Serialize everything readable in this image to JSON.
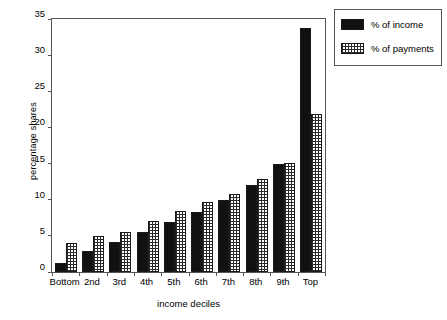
{
  "chart_data": {
    "type": "bar",
    "title": "",
    "xlabel": "income deciles",
    "ylabel": "percentage shares",
    "categories": [
      "Bottom",
      "2nd",
      "3rd",
      "4th",
      "5th",
      "6th",
      "7th",
      "8th",
      "9th",
      "Top"
    ],
    "series": [
      {
        "name": "% of income",
        "color": "#111111",
        "pattern": "solid",
        "values": [
          1.3,
          2.9,
          4.2,
          5.5,
          6.9,
          8.3,
          9.9,
          12.0,
          15.0,
          33.7
        ]
      },
      {
        "name": "% of payments",
        "color": "#2a2a2a",
        "pattern": "checkerboard",
        "values": [
          4.0,
          5.0,
          5.6,
          7.0,
          8.5,
          9.7,
          10.8,
          12.8,
          15.1,
          21.8
        ]
      }
    ],
    "ylim": [
      0,
      35
    ],
    "yticks": [
      0,
      5,
      10,
      15,
      20,
      25,
      30,
      35
    ],
    "ytick_labels": [
      "0",
      "5",
      "10",
      "15",
      "20",
      "25",
      "30",
      "35"
    ],
    "grid": false,
    "legend_position": "outside-top-right"
  },
  "legend": {
    "entries": [
      {
        "label": "% of income",
        "swatch": "solid-black-swatch"
      },
      {
        "label": "% of payments",
        "swatch": "checkered-swatch"
      }
    ]
  }
}
